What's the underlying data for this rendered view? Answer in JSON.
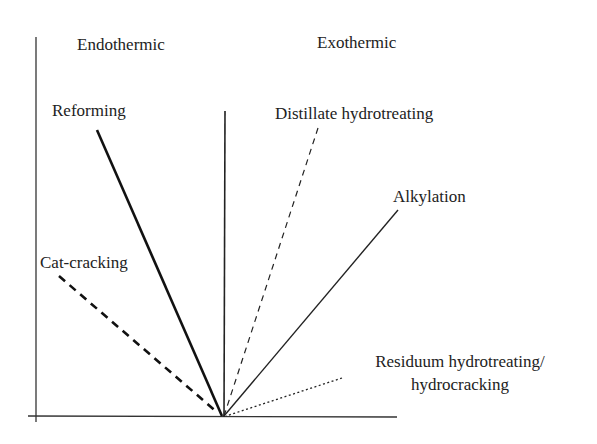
{
  "regions": {
    "left": "Endothermic",
    "right": "Exothermic"
  },
  "processes": [
    {
      "label": "Reforming",
      "side": "endothermic",
      "style": "thick-solid"
    },
    {
      "label": "Cat-cracking",
      "side": "endothermic",
      "style": "thick-dashed"
    },
    {
      "label": "Distillate hydrotreating",
      "side": "exothermic",
      "style": "thin-dashed"
    },
    {
      "label": "Alkylation",
      "side": "exothermic",
      "style": "thin-solid"
    },
    {
      "label": "Residuum hydrotreating/",
      "label_line2": "hydrocracking",
      "side": "exothermic",
      "style": "dotted"
    }
  ],
  "colors": {
    "line": "#222222",
    "background": "#ffffff"
  }
}
